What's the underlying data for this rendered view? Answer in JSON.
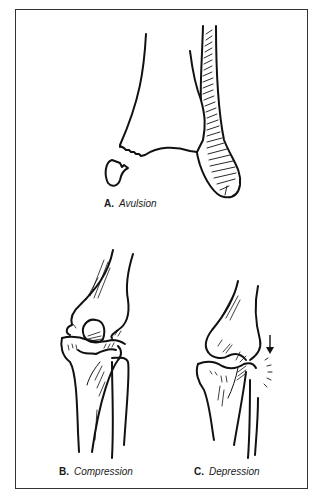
{
  "figure": {
    "panels": [
      {
        "id": "A",
        "letter": "A.",
        "label": "Avulsion",
        "depiction": "ankle bones with avulsed bone fragment"
      },
      {
        "id": "B",
        "letter": "B.",
        "label": "Compression",
        "depiction": "knee joint with compressed condyle"
      },
      {
        "id": "C",
        "letter": "C.",
        "label": "Depression",
        "depiction": "knee joint with depressed tibial plateau and impact arrow"
      }
    ],
    "colors": {
      "background": "#ffffff",
      "line": "#111111",
      "frame": "#333333"
    }
  }
}
